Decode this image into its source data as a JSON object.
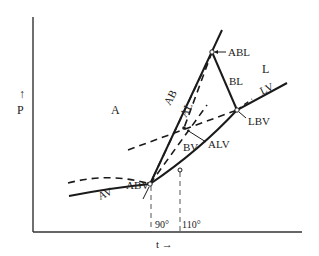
{
  "diagram": {
    "type": "phase-diagram",
    "y_axis": {
      "arrow": "↑",
      "label": "P"
    },
    "x_axis": {
      "label": "t →"
    },
    "regions": {
      "A": "A",
      "L": "L"
    },
    "curves": {
      "AV": "AV",
      "AB": "AB",
      "BL": "BL",
      "LV": "LV",
      "AL": "AL"
    },
    "points": {
      "ABL": "ABL",
      "LBV": "LBV",
      "ABV": "ABV",
      "BV": "BV",
      "ALV": "ALV"
    },
    "ticks": [
      "90°",
      "110°"
    ],
    "colors": {
      "line": "#1a1a1a",
      "axis": "#333333"
    }
  }
}
